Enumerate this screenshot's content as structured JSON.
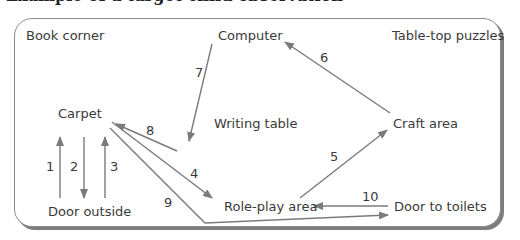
{
  "heading": {
    "text": "Example of a target child observation"
  },
  "locations": {
    "book_corner": "Book corner",
    "computer": "Computer",
    "table_top_puzzles": "Table-top puzzles",
    "carpet": "Carpet",
    "writing_table": "Writing table",
    "craft_area": "Craft area",
    "door_outside": "Door outside",
    "role_play_area": "Role-play area",
    "door_to_toilets": "Door to toilets"
  },
  "movements": [
    {
      "step": "1",
      "from": "Door outside",
      "to": "Carpet"
    },
    {
      "step": "2",
      "from": "Carpet",
      "to": "Door outside"
    },
    {
      "step": "3",
      "from": "Door outside",
      "to": "Carpet"
    },
    {
      "step": "4",
      "from": "Carpet",
      "to": "Role-play area"
    },
    {
      "step": "5",
      "from": "Role-play area",
      "to": "Craft area"
    },
    {
      "step": "6",
      "from": "Craft area",
      "to": "Computer"
    },
    {
      "step": "7",
      "from": "Computer",
      "to": "Writing table"
    },
    {
      "step": "8",
      "from": "Writing table",
      "to": "Carpet"
    },
    {
      "step": "9",
      "from": "Carpet",
      "to": "Door to toilets"
    },
    {
      "step": "10",
      "from": "Door to toilets",
      "to": "Role-play area"
    }
  ],
  "colors": {
    "line": "#7a7a7a",
    "text": "#3a3a3a",
    "border": "#8a8a8a"
  }
}
